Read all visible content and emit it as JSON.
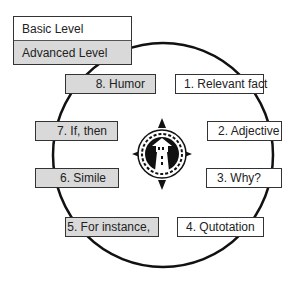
{
  "legend": {
    "basic_label": "Basic Level",
    "advanced_label": "Advanced Level",
    "colors": {
      "basic": "#ffffff",
      "advanced": "#d9d9d9"
    }
  },
  "center_icon": "lighthouse-compass-icon",
  "steps": [
    {
      "label": "1. Relevant fact",
      "level": "basic"
    },
    {
      "label": "2. Adjective",
      "level": "basic"
    },
    {
      "label": "3. Why?",
      "level": "basic"
    },
    {
      "label": "4. Qutotation",
      "level": "basic"
    },
    {
      "label": "5. For instance,",
      "level": "advanced"
    },
    {
      "label": "6. Simile",
      "level": "advanced"
    },
    {
      "label": "7. If, then",
      "level": "advanced"
    },
    {
      "label": "8. Humor",
      "level": "advanced"
    }
  ]
}
